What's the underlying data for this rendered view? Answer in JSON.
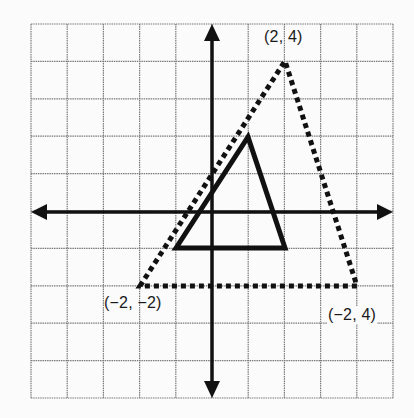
{
  "diagram": {
    "type": "coordinate-plane-transformation",
    "grid": {
      "columns": 10,
      "rows": 10,
      "x_range": [
        -5,
        5
      ],
      "y_range": [
        -5,
        5
      ]
    },
    "axes": {
      "x_axis": "horizontal with arrows both ends",
      "y_axis": "vertical with arrows both ends"
    },
    "shapes": [
      {
        "name": "original-triangle",
        "style": "solid",
        "vertices": [
          [
            -1,
            -1
          ],
          [
            1,
            2
          ],
          [
            2,
            -1
          ]
        ]
      },
      {
        "name": "dilated-triangle",
        "style": "dotted",
        "vertices": [
          [
            -2,
            -2
          ],
          [
            2,
            4
          ],
          [
            4,
            -2
          ]
        ]
      }
    ],
    "labels": {
      "top_vertex": "(2, 4)",
      "left_vertex": "(−2, −2)",
      "right_vertex": "(−2, 4)"
    },
    "colors": {
      "line": "#111111",
      "grid": "#777777",
      "background": "#fbfbfb"
    }
  }
}
